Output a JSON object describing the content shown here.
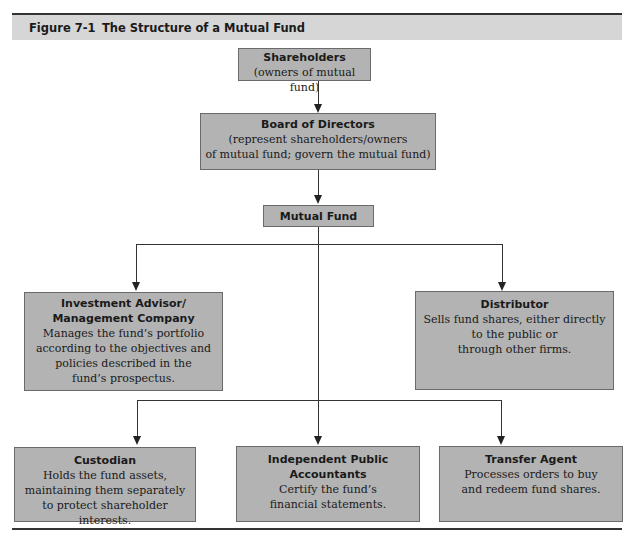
{
  "figure": {
    "number": "Figure 7-1",
    "title": "The Structure of a Mutual Fund"
  },
  "nodes": {
    "shareholders": {
      "title": "Shareholders",
      "desc": "(owners of mutual fund)"
    },
    "board": {
      "title": "Board of Directors",
      "desc": "(represent shareholders/owners\nof mutual fund; govern the mutual fund)"
    },
    "mutual_fund": {
      "title": "Mutual Fund"
    },
    "advisor": {
      "title": "Investment Advisor/\nManagement Company",
      "desc": "Manages the fund’s portfolio\naccording to the objectives and\npolicies described in the\nfund’s prospectus."
    },
    "distributor": {
      "title": "Distributor",
      "desc": "Sells fund shares, either directly\nto the public or\nthrough other firms."
    },
    "custodian": {
      "title": "Custodian",
      "desc": "Holds the fund assets,\nmaintaining them separately\nto protect shareholder interests."
    },
    "accountants": {
      "title": "Independent Public\nAccountants",
      "desc": "Certify the fund’s\nfinancial statements."
    },
    "transfer_agent": {
      "title": "Transfer Agent",
      "desc": "Processes orders to buy\nand redeem fund shares."
    }
  },
  "edges": [
    [
      "shareholders",
      "board"
    ],
    [
      "board",
      "mutual_fund"
    ],
    [
      "mutual_fund",
      "advisor"
    ],
    [
      "mutual_fund",
      "distributor"
    ],
    [
      "mutual_fund",
      "custodian"
    ],
    [
      "mutual_fund",
      "accountants"
    ],
    [
      "mutual_fund",
      "transfer_agent"
    ]
  ],
  "colors": {
    "box_fill": "#b3b3b3",
    "header_fill": "#d6d6d6",
    "line": "#333333"
  }
}
